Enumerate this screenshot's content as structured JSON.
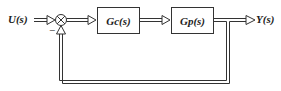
{
  "diagram": {
    "type": "closed-loop block diagram",
    "input": {
      "label": "U(s)"
    },
    "output": {
      "label": "Y(s)"
    },
    "summing_junction": {
      "symbol": "⊗",
      "feedback_sign": "−"
    },
    "blocks": [
      {
        "id": "controller",
        "label": "Gc(s)"
      },
      {
        "id": "plant",
        "label": "Gp(s)"
      }
    ],
    "feedback": {
      "type": "unity",
      "from": "Y(s)",
      "to": "summing_junction"
    }
  }
}
